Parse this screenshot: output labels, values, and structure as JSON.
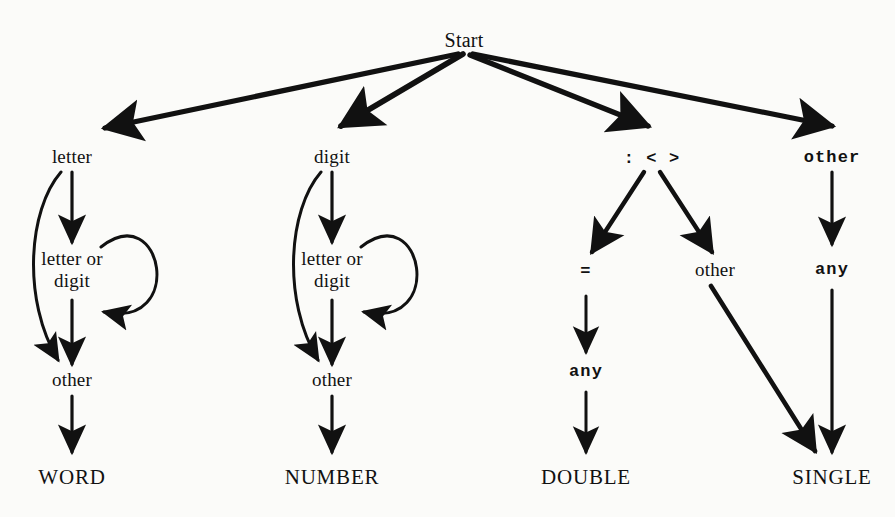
{
  "diagram": {
    "title_node": "Start",
    "background_color": "#fbfbf9",
    "ink_color": "#111111",
    "nodes": {
      "start": "Start",
      "letter": "letter",
      "digit": "digit",
      "punct": ": < >",
      "other_top": "other",
      "letter_or_digit_1": "letter or\ndigit",
      "letter_or_digit_2": "letter or\ndigit",
      "equals": "=",
      "other_mid": "other",
      "any_mid": "any",
      "any_right": "any",
      "other_left": "other",
      "other_left2": "other"
    },
    "terminals": {
      "word": "WORD",
      "number": "NUMBER",
      "double": "DOUBLE",
      "single": "SINGLE"
    }
  }
}
